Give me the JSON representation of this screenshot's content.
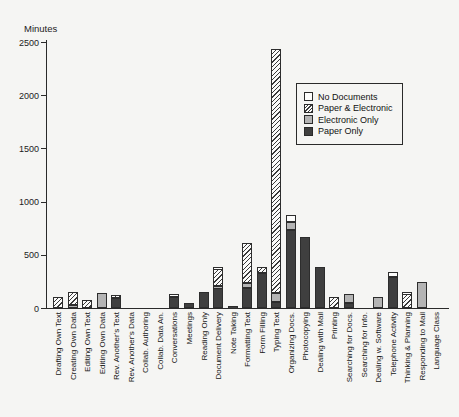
{
  "colors": {
    "background": "#f5f5f3",
    "paper_only": "#3f3f3f",
    "electronic_only": "#b4b4b4",
    "no_documents": "#fdfdfc",
    "hatch_line": "#3a3a3a",
    "axis": "#2a2a2a"
  },
  "legend": {
    "position": "upper-right",
    "entries": [
      {
        "label": "No Documents",
        "key": "no_documents",
        "swatch": "white-square"
      },
      {
        "label": "Paper & Electronic",
        "key": "paper_electronic",
        "swatch": "hatched-square"
      },
      {
        "label": "Electronic Only",
        "key": "electronic_only",
        "swatch": "gray-square"
      },
      {
        "label": "Paper Only",
        "key": "paper_only",
        "swatch": "dark-square"
      }
    ]
  },
  "chart_data": {
    "type": "bar",
    "stacked": true,
    "title": "",
    "xlabel": "",
    "ylabel": "Minutes",
    "ylim": [
      0,
      2500
    ],
    "yticks": [
      0,
      500,
      1000,
      1500,
      2000,
      2500
    ],
    "grid": false,
    "stack_order_bottom_to_top": [
      "Paper Only",
      "Electronic Only",
      "Paper & Electronic",
      "No Documents"
    ],
    "categories": [
      "Drafting Own Text",
      "Creating Own Data",
      "Editing Own Text",
      "Editing Own Data",
      "Rev. Another's Text",
      "Rev. Another's Data",
      "Collab. Authoring",
      "Collab. Data An.",
      "Conversations",
      "Meetings",
      "Reading Only",
      "Document Delivery",
      "Note Taking",
      "Formatting Text",
      "Form Filling",
      "Typing Text",
      "Organizing Docs.",
      "Photocopying",
      "Dealing with Mail",
      "Printing",
      "Searching for Docs.",
      "Searching for Info.",
      "Dealing w. Software",
      "Telephone Activity",
      "Thinking & Planning",
      "Responding to Mail",
      "Language Class"
    ],
    "series": [
      {
        "name": "Paper Only",
        "key": "paper_only",
        "values": [
          0,
          0,
          0,
          0,
          90,
          0,
          0,
          0,
          100,
          50,
          155,
          190,
          15,
          190,
          330,
          60,
          735,
          670,
          390,
          0,
          50,
          0,
          0,
          295,
          0,
          0,
          0
        ]
      },
      {
        "name": "Electronic Only",
        "key": "electronic_only",
        "values": [
          0,
          30,
          0,
          140,
          0,
          0,
          0,
          0,
          0,
          0,
          0,
          15,
          0,
          45,
          0,
          80,
          70,
          0,
          0,
          0,
          80,
          0,
          100,
          0,
          0,
          245,
          0
        ]
      },
      {
        "name": "Paper & Electronic",
        "key": "paper_electronic",
        "values": [
          100,
          120,
          75,
          0,
          30,
          0,
          0,
          0,
          0,
          0,
          0,
          160,
          0,
          375,
          60,
          2290,
          0,
          0,
          0,
          100,
          0,
          0,
          0,
          0,
          130,
          0,
          0
        ]
      },
      {
        "name": "No Documents",
        "key": "no_documents",
        "values": [
          0,
          0,
          0,
          0,
          0,
          0,
          0,
          0,
          30,
          0,
          0,
          20,
          0,
          0,
          0,
          0,
          70,
          0,
          0,
          0,
          0,
          0,
          0,
          45,
          20,
          0,
          0
        ]
      }
    ]
  }
}
